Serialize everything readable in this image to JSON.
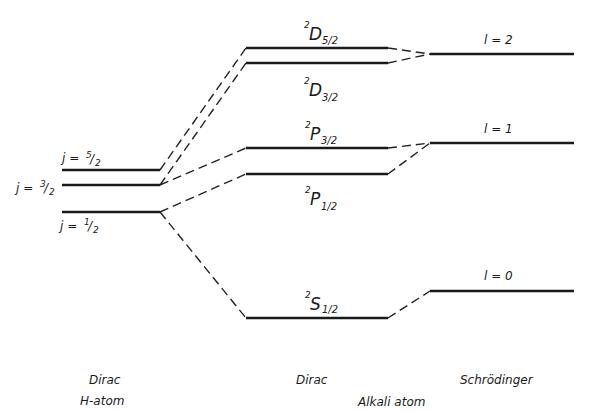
{
  "diagram": {
    "type": "energy-level-diagram",
    "columns": [
      {
        "id": "dirac-h",
        "title_line1": "Dirac",
        "title_line2": "H-atom"
      },
      {
        "id": "dirac-alkali",
        "title_line1": "Dirac",
        "title_line2": "Alkali atom"
      },
      {
        "id": "schrodinger",
        "title_line1": "Schrödinger",
        "title_line2": ""
      }
    ],
    "h_atom_levels": [
      {
        "id": "j52",
        "label_prefix": "j = ",
        "frac_num": "5",
        "frac_den": "2"
      },
      {
        "id": "j32",
        "label_prefix": "j = ",
        "frac_num": "3",
        "frac_den": "2"
      },
      {
        "id": "j12",
        "label_prefix": "j = ",
        "frac_num": "1",
        "frac_den": "2"
      }
    ],
    "alkali_levels": [
      {
        "id": "D52",
        "mult": "2",
        "term": "D",
        "j": "5/2"
      },
      {
        "id": "D32",
        "mult": "2",
        "term": "D",
        "j": "3/2"
      },
      {
        "id": "P32",
        "mult": "2",
        "term": "P",
        "j": "3/2"
      },
      {
        "id": "P12",
        "mult": "2",
        "term": "P",
        "j": "1/2"
      },
      {
        "id": "S12",
        "mult": "2",
        "term": "S",
        "j": "1/2"
      }
    ],
    "schrodinger_levels": [
      {
        "id": "l2",
        "label": "l = 2"
      },
      {
        "id": "l1",
        "label": "l = 1"
      },
      {
        "id": "l0",
        "label": "l = 0"
      }
    ],
    "connections": [
      {
        "from": "j52",
        "to": "D52"
      },
      {
        "from": "j32",
        "to": "D32"
      },
      {
        "from": "j32",
        "to": "P32"
      },
      {
        "from": "j12",
        "to": "P12"
      },
      {
        "from": "j12",
        "to": "S12"
      },
      {
        "from": "D52",
        "to": "l2"
      },
      {
        "from": "D32",
        "to": "l2"
      },
      {
        "from": "P32",
        "to": "l1"
      },
      {
        "from": "P12",
        "to": "l1"
      },
      {
        "from": "S12",
        "to": "l0"
      }
    ]
  }
}
